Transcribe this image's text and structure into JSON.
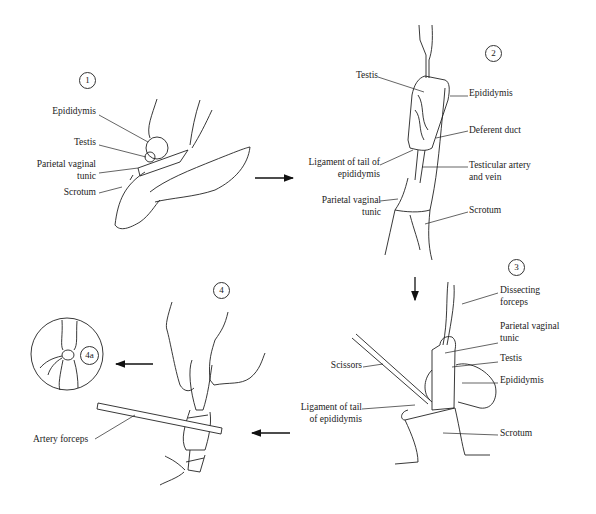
{
  "figure": {
    "panels": [
      {
        "step": "1",
        "labels": [
          "Epididymis",
          "Testis",
          "Parietal vaginal tunic",
          "Scrotum"
        ]
      },
      {
        "step": "2",
        "labels": [
          "Testis",
          "Epididymis",
          "Deferent duct",
          "Ligament of tail of epididymis",
          "Testicular artery and vein",
          "Parietal vaginal tunic",
          "Scrotum"
        ]
      },
      {
        "step": "3",
        "labels": [
          "Dissecting forceps",
          "Parietal vaginal tunic",
          "Testis",
          "Epididymis",
          "Scissors",
          "Ligament of tail of epididymis",
          "Scrotum"
        ]
      },
      {
        "step": "4",
        "labels": [
          "Artery forceps"
        ]
      },
      {
        "step": "4a",
        "labels": []
      }
    ]
  },
  "p1": {
    "step": "1",
    "epididymis": "Epididymis",
    "testis": "Testis",
    "pvt_line1": "Parietal vaginal",
    "pvt_line2": "tunic",
    "scrotum": "Scrotum"
  },
  "p2": {
    "step": "2",
    "testis": "Testis",
    "epididymis": "Epididymis",
    "deferent_duct": "Deferent duct",
    "ligament_line1": "Ligament of tail of",
    "ligament_line2": "epididymis",
    "artery_line1": "Testicular artery",
    "artery_line2": "and vein",
    "pvt_line1": "Parietal vaginal",
    "pvt_line2": "tunic",
    "scrotum": "Scrotum"
  },
  "p3": {
    "step": "3",
    "forceps_line1": "Dissecting",
    "forceps_line2": "forceps",
    "pvt_line1": "Parietal vaginal",
    "pvt_line2": "tunic",
    "testis": "Testis",
    "epididymis": "Epididymis",
    "scissors": "Scissors",
    "ligament_line1": "Ligament of tail",
    "ligament_line2": "of epididymis",
    "scrotum": "Scrotum"
  },
  "p4": {
    "step": "4",
    "inset_step": "4a",
    "artery_forceps": "Artery forceps"
  }
}
